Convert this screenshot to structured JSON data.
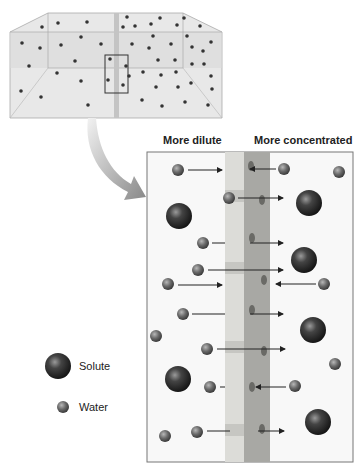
{
  "labels": {
    "left_side": "More dilute",
    "right_side": "More concentrated"
  },
  "legend": [
    {
      "label": "Solute",
      "shape": "large-dark-sphere"
    },
    {
      "label": "Water",
      "shape": "small-gray-sphere"
    }
  ],
  "colors": {
    "box_fill": "#e4e4e4",
    "membrane_light": "#dcdcd8",
    "membrane_dark": "#a8a8a4",
    "solute": "#2a2a2a",
    "water": "#6a6a6a",
    "arrow": "#222222"
  }
}
